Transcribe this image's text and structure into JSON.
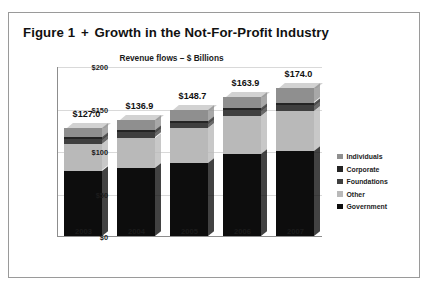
{
  "figure": {
    "title_prefix": "Figure 1",
    "title_separator": "+",
    "title_main": "Growth in the Not-For-Profit Industry"
  },
  "legend": {
    "position": "right",
    "items": [
      {
        "label": "Individuals",
        "color": "#8f8f8f"
      },
      {
        "label": "Corporate",
        "color": "#242424"
      },
      {
        "label": "Foundations",
        "color": "#3f3f3f"
      },
      {
        "label": "Other",
        "color": "#b9b9b9"
      },
      {
        "label": "Government",
        "color": "#0d0d0d"
      }
    ]
  },
  "chart_data": {
    "type": "bar",
    "title": "Revenue flows – $ Billions",
    "subtitle": "",
    "xlabel": "",
    "ylabel": "",
    "stacked": true,
    "grid": true,
    "ylim": [
      0,
      200
    ],
    "yticks": [
      "$0",
      "$50",
      "$100",
      "$150",
      "$200"
    ],
    "ytick_values": [
      0,
      50,
      100,
      150,
      200
    ],
    "categories": [
      "2003",
      "2004",
      "2005",
      "2006",
      "2007"
    ],
    "totals": [
      127.0,
      136.9,
      148.7,
      163.9,
      174.0
    ],
    "total_labels": [
      "$127.0",
      "$136.9",
      "$148.7",
      "$163.9",
      "$174.0"
    ],
    "series": [
      {
        "name": "Government",
        "color": "#0d0d0d",
        "values": [
          77.0,
          80.0,
          86.0,
          96.0,
          100.0
        ]
      },
      {
        "name": "Other",
        "color": "#b9b9b9",
        "values": [
          31.0,
          35.9,
          40.7,
          44.9,
          47.0
        ]
      },
      {
        "name": "Foundations",
        "color": "#3f3f3f",
        "values": [
          6.0,
          6.0,
          6.0,
          7.0,
          7.0
        ]
      },
      {
        "name": "Corporate",
        "color": "#242424",
        "values": [
          3.0,
          3.0,
          3.0,
          3.0,
          3.0
        ]
      },
      {
        "name": "Individuals",
        "color": "#8f8f8f",
        "values": [
          10.0,
          12.0,
          13.0,
          13.0,
          17.0
        ]
      }
    ]
  }
}
